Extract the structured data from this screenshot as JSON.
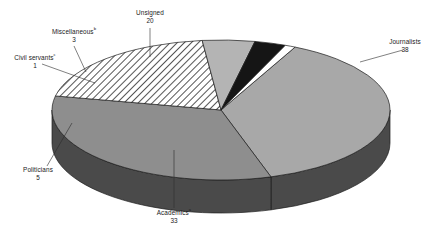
{
  "chart_data": {
    "type": "pie",
    "title": "",
    "subtitle": "",
    "xlabel": "",
    "ylabel": "",
    "legend_position": "none",
    "grid": false,
    "three_d": true,
    "total": 100,
    "categories": [
      "Journalists",
      "Academics",
      "Unsigned",
      "Politicians",
      "Miscellaneous",
      "Civil servants"
    ],
    "values": [
      38,
      33,
      20,
      5,
      3,
      1
    ],
    "slices": [
      {
        "label": "Journalists",
        "footnote": "",
        "value": 38,
        "value_text": "38",
        "color": "#a8a8a8",
        "side_color": "#4a4a4a",
        "fill_style": "solid",
        "label_x": 405,
        "label_y": 44,
        "value_x": 405,
        "value_y": 52
      },
      {
        "label": "Academics",
        "footnote": "a",
        "value": 33,
        "value_text": "33",
        "color": "#8e8e8e",
        "side_color": "#4a4a4a",
        "fill_style": "solid",
        "label_x": 174,
        "label_y": 215,
        "value_x": 174,
        "value_y": 223
      },
      {
        "label": "Unsigned",
        "footnote": "",
        "value": 20,
        "value_text": "20",
        "color": "#ffffff",
        "side_color": "#4a4a4a",
        "fill_style": "hatched",
        "label_x": 150,
        "label_y": 15,
        "value_x": 150,
        "value_y": 23
      },
      {
        "label": "Politicians",
        "footnote": "",
        "value": 5,
        "value_text": "5",
        "color": "#b4b4b4",
        "side_color": "#4a4a4a",
        "fill_style": "solid",
        "label_x": 38,
        "label_y": 172,
        "value_x": 38,
        "value_y": 180
      },
      {
        "label": "Miscellaneous",
        "footnote": "b",
        "value": 3,
        "value_text": "3",
        "color": "#151515",
        "side_color": "#0d0d0d",
        "fill_style": "solid",
        "label_x": 74,
        "label_y": 34,
        "value_x": 74,
        "value_y": 42
      },
      {
        "label": "Civil servants",
        "footnote": "c",
        "value": 1,
        "value_text": "1",
        "color": "#ffffff",
        "side_color": "#5a5a5a",
        "fill_style": "solid",
        "label_x": 35,
        "label_y": 60,
        "value_x": 35,
        "value_y": 68
      }
    ],
    "background": "#ffffff",
    "outline_color": "#1c1c1c"
  }
}
